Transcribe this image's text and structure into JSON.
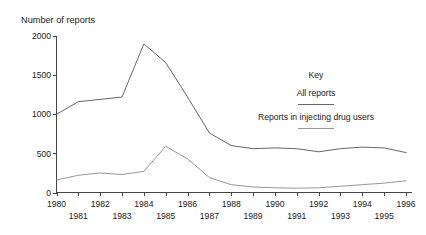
{
  "chart_data": {
    "type": "line",
    "title": "Number of reports",
    "xlabel": "",
    "ylabel": "Number of reports",
    "ylim": [
      0,
      2000
    ],
    "xlim": [
      1980,
      1996
    ],
    "grid": false,
    "legend_position": "inside-right",
    "legend_title": "Key",
    "y_ticks": [
      0,
      500,
      1000,
      1500,
      2000
    ],
    "y_tick_labels": [
      "0",
      "500",
      "1000",
      "1500",
      "2000"
    ],
    "x": [
      1980,
      1981,
      1982,
      1983,
      1984,
      1985,
      1986,
      1987,
      1988,
      1989,
      1990,
      1991,
      1992,
      1993,
      1994,
      1995,
      1996
    ],
    "x_tick_labels": [
      "1980",
      "1981",
      "1982",
      "1983",
      "1984",
      "1985",
      "1986",
      "1987",
      "1988",
      "1989",
      "1990",
      "1991",
      "1992",
      "1993",
      "1994",
      "1995",
      "1996"
    ],
    "x_labels_top": [
      "1980",
      "1982",
      "1984",
      "1986",
      "1988",
      "1990",
      "1992",
      "1994",
      "1996"
    ],
    "x_labels_bottom": [
      "1981",
      "1983",
      "1985",
      "1987",
      "1989",
      "1991",
      "1993",
      "1995"
    ],
    "series": [
      {
        "name": "All reports",
        "color": "#555555",
        "values": [
          1000,
          1160,
          1190,
          1220,
          1900,
          1660,
          1220,
          760,
          600,
          560,
          570,
          560,
          520,
          560,
          580,
          570,
          510
        ]
      },
      {
        "name": "Reports in injecting drug users",
        "color": "#8a8a8a",
        "values": [
          160,
          220,
          250,
          230,
          270,
          590,
          430,
          190,
          100,
          70,
          60,
          55,
          60,
          80,
          100,
          120,
          150
        ]
      }
    ]
  },
  "legend": {
    "title": "Key",
    "entries": [
      {
        "label": "All reports"
      },
      {
        "label": "Reports in injecting drug users"
      }
    ]
  },
  "axes": {
    "y_title": "Number of reports"
  }
}
